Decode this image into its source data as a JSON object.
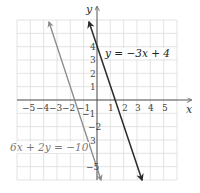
{
  "chart_data": {
    "type": "line",
    "title": "",
    "xlabel": "x",
    "ylabel": "y",
    "xlim": [
      -6,
      6
    ],
    "ylim": [
      -6,
      6
    ],
    "grid": true,
    "x_ticks": [
      "-5",
      "-4",
      "-3",
      "-2",
      "-1",
      "1",
      "2",
      "3",
      "4",
      "5"
    ],
    "y_ticks": [
      "4",
      "3",
      "2",
      "1",
      "-1",
      "-2",
      "-3",
      "-5"
    ],
    "series": [
      {
        "name": "y = −3x + 4",
        "equation": "y = -3x + 4",
        "slope": -3,
        "intercept": 4,
        "color": "#2a2a2a",
        "points": [
          [
            -0.6,
            5.8
          ],
          [
            3.4,
            -6.0
          ]
        ]
      },
      {
        "name": "6x + 2y = −10",
        "equation": "6x + 2y = -10",
        "slope": -3,
        "intercept": -5,
        "color": "#8a8a8a",
        "points": [
          [
            -3.6,
            5.8
          ],
          [
            0.3,
            -6.0
          ]
        ]
      }
    ],
    "annotations": [
      {
        "text": "y = −3x + 4",
        "near": "dark line, upper right"
      },
      {
        "text": "6x + 2y = −10",
        "near": "gray line, lower left"
      }
    ]
  },
  "labels": {
    "x_axis": "x",
    "y_axis": "y",
    "line1": "y = −3x + 4",
    "line2": "6x + 2y = −10",
    "xt": [
      "−5",
      "−4",
      "−3",
      "−2",
      "−1",
      "1",
      "2",
      "3",
      "4",
      "5"
    ],
    "yt": [
      "4",
      "3",
      "2",
      "1",
      "−1",
      "−2",
      "3",
      "−5"
    ]
  }
}
